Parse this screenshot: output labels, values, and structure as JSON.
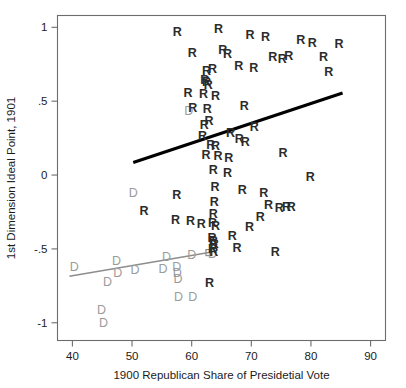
{
  "chart_data": {
    "type": "scatter",
    "title": "",
    "xlabel": "1900 Republican Share of Presidetial Vote",
    "ylabel": "1st Dimension Ideal Point, 1901",
    "xlim": [
      37.5,
      92.5
    ],
    "ylim": [
      -1.12,
      1.08
    ],
    "xticks": [
      40,
      50,
      60,
      70,
      80,
      90
    ],
    "xtick_labels": [
      "40",
      "50",
      "60",
      "70",
      "80",
      "90"
    ],
    "yticks": [
      1,
      0.5,
      0,
      -0.5,
      -1
    ],
    "ytick_labels": [
      "1",
      ".5",
      "0",
      "-.5",
      "-1"
    ],
    "grid": false,
    "legend": null,
    "marker_style": "text-glyph",
    "series": [
      {
        "name": "R",
        "label": "R",
        "marker": "R",
        "color": "#2b2b2b",
        "points": [
          [
            57.6,
            0.97
          ],
          [
            64.5,
            0.99
          ],
          [
            69.8,
            0.95
          ],
          [
            72.4,
            0.94
          ],
          [
            78.3,
            0.92
          ],
          [
            80.2,
            0.9
          ],
          [
            84.7,
            0.89
          ],
          [
            60.1,
            0.83
          ],
          [
            65.2,
            0.85
          ],
          [
            66.0,
            0.82
          ],
          [
            73.6,
            0.8
          ],
          [
            75.2,
            0.79
          ],
          [
            76.3,
            0.81
          ],
          [
            82.1,
            0.8
          ],
          [
            62.5,
            0.71
          ],
          [
            63.5,
            0.72
          ],
          [
            67.9,
            0.74
          ],
          [
            70.4,
            0.73
          ],
          [
            62.2,
            0.65
          ],
          [
            62.5,
            0.63
          ],
          [
            62.8,
            0.61
          ],
          [
            83.0,
            0.7
          ],
          [
            59.4,
            0.56
          ],
          [
            62.0,
            0.55
          ],
          [
            64.0,
            0.54
          ],
          [
            60.2,
            0.46
          ],
          [
            62.6,
            0.45
          ],
          [
            68.8,
            0.47
          ],
          [
            62.1,
            0.34
          ],
          [
            62.9,
            0.37
          ],
          [
            70.5,
            0.33
          ],
          [
            61.8,
            0.27
          ],
          [
            66.5,
            0.29
          ],
          [
            63.2,
            0.21
          ],
          [
            64.0,
            0.2
          ],
          [
            68.0,
            0.25
          ],
          [
            69.0,
            0.23
          ],
          [
            62.4,
            0.14
          ],
          [
            64.4,
            0.13
          ],
          [
            66.2,
            0.12
          ],
          [
            75.3,
            0.15
          ],
          [
            63.6,
            0.04
          ],
          [
            66.0,
            0.02
          ],
          [
            79.9,
            -0.01
          ],
          [
            63.9,
            -0.08
          ],
          [
            68.5,
            -0.1
          ],
          [
            72.1,
            -0.12
          ],
          [
            57.5,
            -0.13
          ],
          [
            63.8,
            -0.18
          ],
          [
            72.9,
            -0.2
          ],
          [
            74.7,
            -0.22
          ],
          [
            75.9,
            -0.21
          ],
          [
            76.7,
            -0.21
          ],
          [
            52.0,
            -0.24
          ],
          [
            63.6,
            -0.26
          ],
          [
            71.5,
            -0.28
          ],
          [
            63.5,
            -0.32
          ],
          [
            64.0,
            -0.34
          ],
          [
            69.7,
            -0.35
          ],
          [
            57.3,
            -0.3
          ],
          [
            59.8,
            -0.31
          ],
          [
            61.6,
            -0.33
          ],
          [
            63.4,
            -0.42
          ],
          [
            63.6,
            -0.44
          ],
          [
            63.8,
            -0.46
          ],
          [
            66.8,
            -0.41
          ],
          [
            63.5,
            -0.5
          ],
          [
            63.7,
            -0.52
          ],
          [
            67.6,
            -0.49
          ],
          [
            74.0,
            -0.52
          ],
          [
            63.0,
            -0.73
          ]
        ]
      },
      {
        "name": "D",
        "label": "D",
        "marker": "D",
        "color": "#9b9b9b",
        "points": [
          [
            59.5,
            0.44
          ],
          [
            50.2,
            -0.12
          ],
          [
            40.3,
            -0.62
          ],
          [
            47.4,
            -0.58
          ],
          [
            55.8,
            -0.55
          ],
          [
            60.0,
            -0.54
          ],
          [
            63.5,
            -0.53
          ],
          [
            47.6,
            -0.66
          ],
          [
            50.5,
            -0.64
          ],
          [
            55.2,
            -0.63
          ],
          [
            57.5,
            -0.62
          ],
          [
            57.6,
            -0.66
          ],
          [
            57.7,
            -0.7
          ],
          [
            45.9,
            -0.72
          ],
          [
            57.8,
            -0.82
          ],
          [
            60.2,
            -0.82
          ],
          [
            44.9,
            -0.91
          ],
          [
            45.2,
            -1.0
          ]
        ]
      }
    ],
    "fit_lines": [
      {
        "name": "republican-fit",
        "series": "R",
        "color": "#000000",
        "width": 3.1,
        "x_start": 50.2,
        "y_start": 0.085,
        "x_end": 85.3,
        "y_end": 0.555,
        "end_marker": false
      },
      {
        "name": "democrat-fit",
        "series": "D",
        "color": "#8d8d8d",
        "width": 1.5,
        "x_start": 39.5,
        "y_start": -0.685,
        "x_end": 62.9,
        "y_end": -0.525,
        "end_marker": true
      }
    ]
  }
}
